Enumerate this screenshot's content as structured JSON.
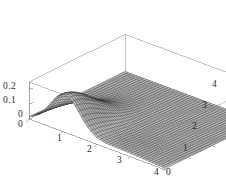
{
  "figure": {
    "kind": "surface-plot-3d",
    "background_color": "#ffffff",
    "frame_color": "#9a9a9a",
    "mesh_color": "#1a1a1a",
    "width": 226,
    "height": 191
  },
  "chart_data": {
    "type": "surface",
    "title": "",
    "xlabel": "",
    "ylabel": "",
    "zlabel": "",
    "grid": false,
    "legend": null,
    "projection": "3d-parallel",
    "xlim": [
      0,
      4
    ],
    "ylim": [
      0,
      4
    ],
    "zlim": [
      0,
      0.25
    ],
    "x_ticks": [
      0,
      1,
      2,
      3,
      4
    ],
    "x_tick_labels": [
      "0",
      "1",
      "2",
      "3",
      "4"
    ],
    "y_ticks": [
      0,
      1,
      2,
      3,
      4
    ],
    "y_tick_labels": [
      "0",
      "1",
      "2",
      "3",
      "4"
    ],
    "z_ticks": [
      0,
      0.1,
      0.2
    ],
    "z_tick_labels": [
      "0",
      "0.1",
      "0.2"
    ],
    "mesh_divisions_x": 44,
    "mesh_divisions_y": 44,
    "surface_description": "Gaussian-like ridge rising from near zero, peaking at about z = 0.24 near x = 1 along the low-y edge, decaying toward zero for large x and large y",
    "peak_value": 0.24,
    "peak_location": {
      "x": 1.0,
      "y": 0.3
    },
    "min_value": 0.0
  },
  "axes": {
    "z_ticks": [
      {
        "label": "0.2",
        "left": 3,
        "top": 82
      },
      {
        "label": "0.1",
        "left": 3,
        "top": 96
      },
      {
        "label": "0",
        "left": 18,
        "top": 110
      }
    ],
    "x_ticks": [
      {
        "label": "0",
        "left": 18,
        "top": 120
      },
      {
        "label": "1",
        "left": 57,
        "top": 134
      },
      {
        "label": "2",
        "left": 87,
        "top": 145
      },
      {
        "label": "3",
        "left": 117,
        "top": 156
      },
      {
        "label": "4",
        "left": 154,
        "top": 168
      }
    ],
    "y_ticks": [
      {
        "label": "0",
        "left": 166,
        "top": 168
      },
      {
        "label": "1",
        "left": 183,
        "top": 144
      },
      {
        "label": "2",
        "left": 192,
        "top": 122
      },
      {
        "label": "3",
        "left": 202,
        "top": 101
      },
      {
        "label": "4",
        "left": 212,
        "top": 80
      }
    ]
  }
}
